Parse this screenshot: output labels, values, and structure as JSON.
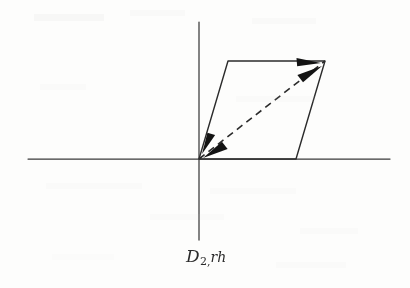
{
  "figure": {
    "caption": {
      "full_text": "D2,rh",
      "symbol": "D",
      "subscript": "2,",
      "suffix": "rh"
    },
    "background_color": "#fdfdfc",
    "ink_color": "#2b2b2b",
    "axis_color": "#3a3a3a"
  },
  "chart_data": {
    "type": "diagram",
    "title": "D2,rh",
    "coordinate_system": {
      "origin": [
        199,
        159
      ],
      "x_axis": {
        "from": [
          28,
          159
        ],
        "to": [
          390,
          159
        ]
      },
      "y_axis": {
        "from": [
          199,
          22
        ],
        "to": [
          199,
          240
        ]
      }
    },
    "parallelogram": {
      "vertices": [
        [
          199,
          159
        ],
        [
          228,
          61
        ],
        [
          325,
          61
        ],
        [
          296,
          159
        ]
      ],
      "stroke": "#2b2b2b",
      "stroke_width": 1.4,
      "fill": "none"
    },
    "diagonal": {
      "from": [
        199,
        159
      ],
      "to": [
        325,
        61
      ],
      "style": "dashed",
      "dash_length": 7,
      "gap_length": 5,
      "stroke": "#2b2b2b",
      "stroke_width": 1.6
    },
    "arrowheads": [
      {
        "name": "origin-edge-arrow",
        "tip": [
          202,
          154
        ],
        "angle_deg": -73,
        "length": 22,
        "half_width": 7
      },
      {
        "name": "origin-diagonal-arrow",
        "tip": [
          203,
          158
        ],
        "angle_deg": -38,
        "length": 25,
        "half_width": 8
      },
      {
        "name": "vertex-top-arrow",
        "tip": [
          321,
          63
        ],
        "angle_deg": 175,
        "length": 24,
        "half_width": 7
      },
      {
        "name": "vertex-diagonal-arrow",
        "tip": [
          322,
          66
        ],
        "angle_deg": 142,
        "length": 25,
        "half_width": 8
      }
    ]
  }
}
